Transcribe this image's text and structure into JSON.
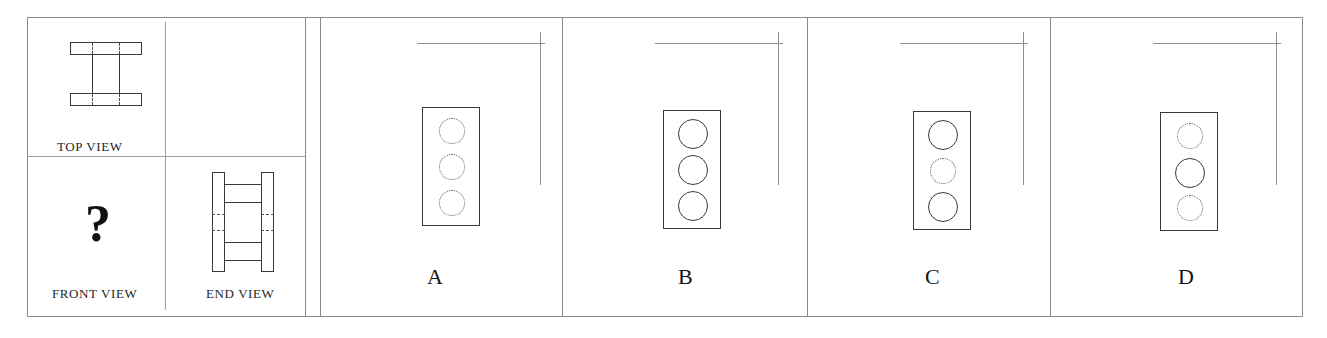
{
  "document": {
    "type": "orthographic-projection-question",
    "instruction_implied": "Select the correct front view"
  },
  "problem_panel": {
    "top_view_label": "TOP VIEW",
    "front_view_label": "FRONT VIEW",
    "end_view_label": "END VIEW",
    "missing_view_marker": "?",
    "top_view": {
      "shape": "I-beam plan",
      "hidden_line_ticks": 4
    },
    "end_view": {
      "shape": "channel-section end view",
      "web_lines": 4,
      "hidden_dashes": 4
    }
  },
  "options": [
    {
      "letter": "A",
      "rect": "vertical rectangle",
      "circles": [
        {
          "style": "hidden",
          "size": "small"
        },
        {
          "style": "hidden",
          "size": "small"
        },
        {
          "style": "hidden",
          "size": "small"
        }
      ]
    },
    {
      "letter": "B",
      "rect": "vertical rectangle",
      "circles": [
        {
          "style": "solid",
          "size": "large"
        },
        {
          "style": "solid",
          "size": "large"
        },
        {
          "style": "solid",
          "size": "large"
        }
      ]
    },
    {
      "letter": "C",
      "rect": "vertical rectangle",
      "circles": [
        {
          "style": "solid",
          "size": "large"
        },
        {
          "style": "hidden",
          "size": "small"
        },
        {
          "style": "solid",
          "size": "large"
        }
      ]
    },
    {
      "letter": "D",
      "rect": "vertical rectangle",
      "circles": [
        {
          "style": "hidden",
          "size": "small"
        },
        {
          "style": "solid",
          "size": "large"
        },
        {
          "style": "hidden",
          "size": "small"
        }
      ]
    }
  ],
  "colors": {
    "frame": "#8a8a8a",
    "object_line": "#3a3a3a",
    "hidden_line": "#5a5a5a",
    "background": "#ffffff",
    "text": "#1a1a1a"
  }
}
